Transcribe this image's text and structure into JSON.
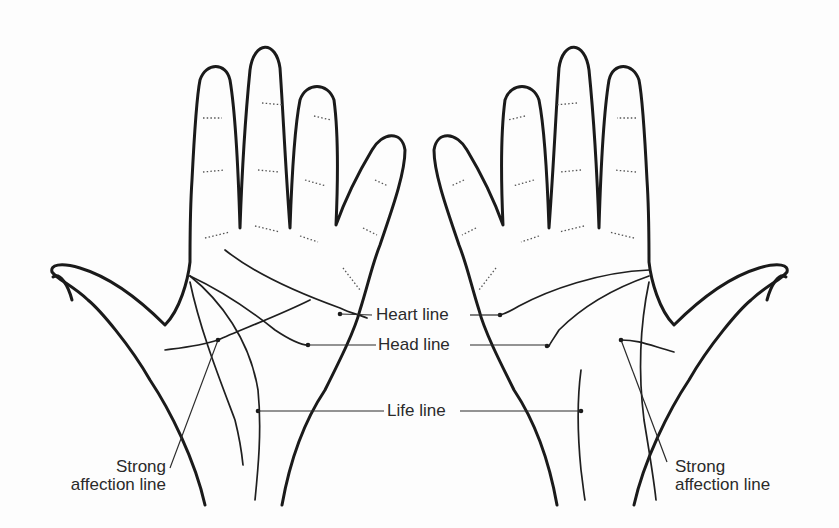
{
  "diagram": {
    "type": "palmistry-hand-lines",
    "hands": [
      "left-hand",
      "right-hand"
    ],
    "labels": {
      "heart_line": "Heart line",
      "head_line": "Head line",
      "life_line": "Life line",
      "affection_left_1": "Strong",
      "affection_left_2": "affection line",
      "affection_right_1": "Strong",
      "affection_right_2": "affection line"
    },
    "colors": {
      "ink": "#1a1a1a",
      "background": "#fdfdfd"
    }
  }
}
